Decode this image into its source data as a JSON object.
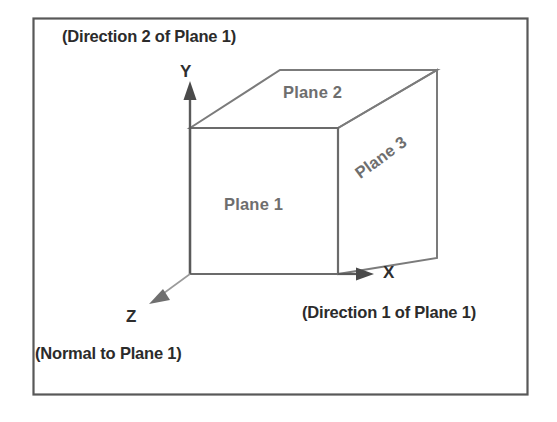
{
  "figure": {
    "border_color": "#555555",
    "line_color": "#6b6b6b",
    "text_color": "#2b2b2b",
    "plane_label_color": "#6e6e6e",
    "background": "#ffffff"
  },
  "annotations": {
    "direction2": "(Direction 2 of Plane 1)",
    "direction1": "(Direction 1 of Plane 1)",
    "normal": "(Normal to Plane 1)"
  },
  "axes": {
    "x": "X",
    "y": "Y",
    "z": "Z"
  },
  "planes": {
    "plane1": "Plane 1",
    "plane2": "Plane 2",
    "plane3": "Plane 3"
  }
}
